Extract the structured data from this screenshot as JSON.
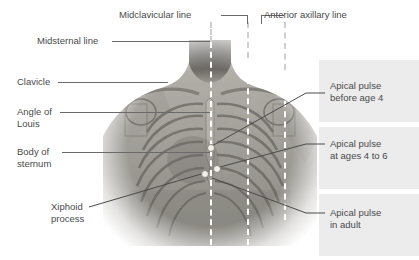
{
  "figure": {
    "background_color": "#ffffff",
    "text_color": "#4a4a4a",
    "leader_color": "#6a6a6a",
    "panel_color": "#ececed",
    "reference_line_color": "#ffffff"
  },
  "labels_left": [
    {
      "id": "midsternal-line",
      "text": "Midsternal line"
    },
    {
      "id": "clavicle",
      "text": "Clavicle"
    },
    {
      "id": "angle-of-louis",
      "text": "Angle of\nLouis"
    },
    {
      "id": "body-of-sternum",
      "text": "Body of\nsternum"
    },
    {
      "id": "xiphoid-process",
      "text": "Xiphoid\nprocess"
    }
  ],
  "labels_top": [
    {
      "id": "midclavicular-line",
      "text": "Midclavicular line"
    },
    {
      "id": "anterior-axillary-line",
      "text": "Anterior axillary line"
    }
  ],
  "labels_right": [
    {
      "id": "apical-pulse-before-age-4",
      "text": "Apical pulse\nbefore age 4"
    },
    {
      "id": "apical-pulse-ages-4-to-6",
      "text": "Apical pulse\nat ages 4 to 6"
    },
    {
      "id": "apical-pulse-adult",
      "text": "Apical pulse\nin adult"
    }
  ],
  "reference_lines": [
    {
      "id": "midsternal",
      "label": "Midsternal line"
    },
    {
      "id": "midclavicular",
      "label": "Midclavicular line"
    },
    {
      "id": "anterior-axillary",
      "label": "Anterior axillary line"
    }
  ],
  "markers": [
    {
      "id": "marker-before-age-4"
    },
    {
      "id": "marker-ages-4-to-6"
    },
    {
      "id": "marker-adult"
    }
  ]
}
